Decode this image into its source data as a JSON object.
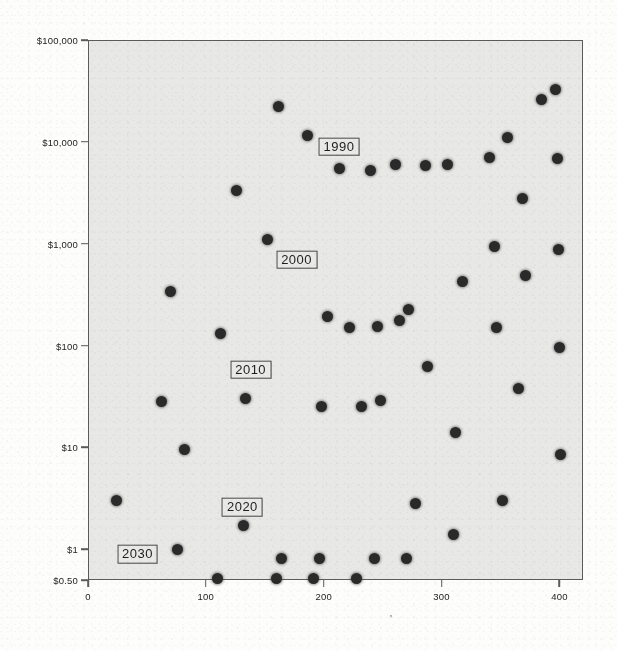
{
  "figure": {
    "kind": "scanned-scatter-figure",
    "background_color": "#fdfdfc",
    "plot_background_color": "#e8e8e6",
    "axis_color": "#5b5b5b",
    "marker_color": "#2a2a2a",
    "stray_mark": "'"
  },
  "bleed_through_text": [
    "of a number of",
    "the price of a",
    "computing and",
    "of memory and",
    "processing the",
    "in the cost of",
    "per unit of",
    "and the same"
  ],
  "chart_data": {
    "type": "scatter",
    "title": "",
    "subtitle": "",
    "xlabel": "",
    "ylabel": "",
    "xlim": [
      0,
      420
    ],
    "ylim": [
      0.5,
      100000
    ],
    "yscale": "log",
    "xscale": "linear",
    "grid": false,
    "legend": null,
    "xticks": [
      0,
      100,
      200,
      300,
      400
    ],
    "xtick_labels": [
      "0",
      "100",
      "200",
      "300",
      "400"
    ],
    "yticks": [
      100000,
      10000,
      1000,
      100,
      10,
      1,
      0.5
    ],
    "ytick_labels": [
      "$100,000",
      "$10,000",
      "$1,000",
      "$100",
      "$10",
      "$1",
      "$0.50"
    ],
    "annotations": [
      {
        "label": "1990",
        "x": 213,
        "y": 9000
      },
      {
        "label": "2000",
        "x": 177,
        "y": 700
      },
      {
        "label": "2010",
        "x": 138,
        "y": 58
      },
      {
        "label": "2020",
        "x": 131,
        "y": 2.6
      },
      {
        "label": "2030",
        "x": 42,
        "y": 0.9
      }
    ],
    "series": [
      {
        "name": "observations",
        "marker": "filled-circle",
        "color": "#2a2a2a",
        "points": [
          {
            "x": 24,
            "y": 3.0
          },
          {
            "x": 62,
            "y": 28
          },
          {
            "x": 70,
            "y": 340
          },
          {
            "x": 76,
            "y": 1.0
          },
          {
            "x": 82,
            "y": 9.5
          },
          {
            "x": 110,
            "y": 0.52
          },
          {
            "x": 112,
            "y": 130
          },
          {
            "x": 126,
            "y": 3300
          },
          {
            "x": 132,
            "y": 1.7
          },
          {
            "x": 134,
            "y": 30
          },
          {
            "x": 152,
            "y": 1100
          },
          {
            "x": 160,
            "y": 0.52
          },
          {
            "x": 162,
            "y": 22000
          },
          {
            "x": 164,
            "y": 0.82
          },
          {
            "x": 186,
            "y": 11500
          },
          {
            "x": 191,
            "y": 0.52
          },
          {
            "x": 196,
            "y": 0.82
          },
          {
            "x": 198,
            "y": 25
          },
          {
            "x": 203,
            "y": 195
          },
          {
            "x": 213,
            "y": 5500
          },
          {
            "x": 222,
            "y": 150
          },
          {
            "x": 228,
            "y": 0.52
          },
          {
            "x": 232,
            "y": 25
          },
          {
            "x": 240,
            "y": 5200
          },
          {
            "x": 243,
            "y": 0.82
          },
          {
            "x": 246,
            "y": 155
          },
          {
            "x": 248,
            "y": 29
          },
          {
            "x": 261,
            "y": 6000
          },
          {
            "x": 264,
            "y": 175
          },
          {
            "x": 270,
            "y": 0.82
          },
          {
            "x": 272,
            "y": 225
          },
          {
            "x": 278,
            "y": 2.8
          },
          {
            "x": 286,
            "y": 5800
          },
          {
            "x": 288,
            "y": 62
          },
          {
            "x": 305,
            "y": 6000
          },
          {
            "x": 310,
            "y": 1.4
          },
          {
            "x": 312,
            "y": 14
          },
          {
            "x": 318,
            "y": 430
          },
          {
            "x": 341,
            "y": 7000
          },
          {
            "x": 345,
            "y": 940
          },
          {
            "x": 347,
            "y": 150
          },
          {
            "x": 352,
            "y": 3.0
          },
          {
            "x": 356,
            "y": 11000
          },
          {
            "x": 365,
            "y": 38
          },
          {
            "x": 369,
            "y": 2800
          },
          {
            "x": 371,
            "y": 490
          },
          {
            "x": 385,
            "y": 26000
          },
          {
            "x": 397,
            "y": 33000
          },
          {
            "x": 398,
            "y": 6800
          },
          {
            "x": 399,
            "y": 880
          },
          {
            "x": 400,
            "y": 95
          },
          {
            "x": 401,
            "y": 8.5
          }
        ]
      }
    ]
  }
}
